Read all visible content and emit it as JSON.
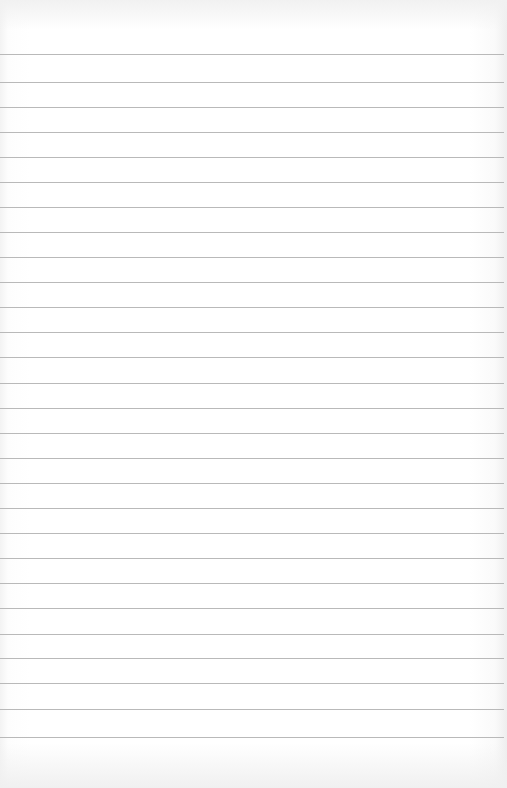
{
  "page": {
    "type": "lined-paper",
    "background_color": "#ffffff",
    "rule_color": "#b9b9b9",
    "rule_count": 28,
    "rule_positions_y": [
      54,
      82,
      107,
      132,
      157,
      182,
      207,
      232,
      257,
      282,
      307,
      332,
      357,
      383,
      408,
      433,
      458,
      483,
      508,
      533,
      558,
      583,
      608,
      634,
      658,
      683,
      709,
      737
    ]
  }
}
